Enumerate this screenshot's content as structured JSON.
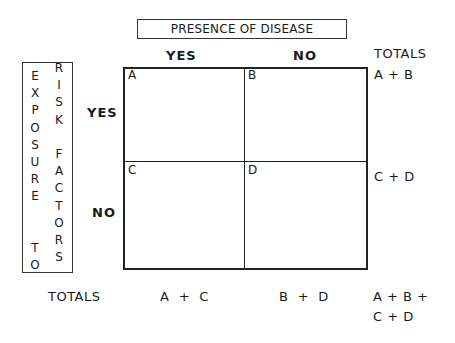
{
  "title": "PRESENCE OF DISEASE",
  "columns": [
    {
      "label": "YES"
    },
    {
      "label": "NO"
    }
  ],
  "rows": [
    {
      "label": "YES"
    },
    {
      "label": "NO"
    }
  ],
  "row_axis": {
    "line1": [
      "E",
      "X",
      "P",
      "O",
      "S",
      "U",
      "R",
      "E",
      "",
      "",
      "T",
      "O"
    ],
    "line2": [
      "R",
      "I",
      "S",
      "K",
      "",
      "F",
      "A",
      "C",
      "T",
      "O",
      "R",
      "S"
    ],
    "text": "EXPOSURE TO RISK FACTORS"
  },
  "cells": {
    "a": "A",
    "b": "B",
    "c": "C",
    "d": "D"
  },
  "totals": {
    "header": "TOTALS",
    "row_yes": "A + B",
    "row_no": "C + D",
    "bottom_label": "TOTALS",
    "col_yes": "A  +  C",
    "col_no": "B  +  D",
    "grand_line1": "A + B +",
    "grand_line2": "C + D"
  }
}
